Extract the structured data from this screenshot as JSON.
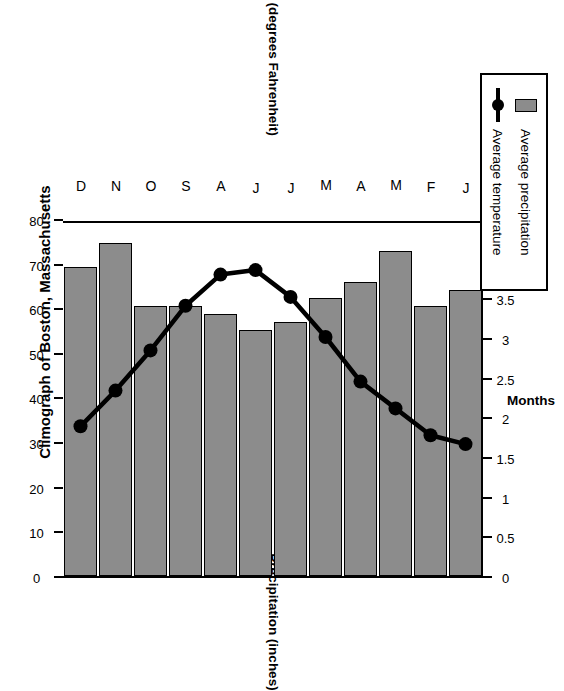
{
  "chart_data": {
    "type": "bar",
    "title": "Climograph of Boston, Massachusetts",
    "orientation": "rotated-90",
    "categories": [
      "J",
      "F",
      "M",
      "A",
      "M",
      "J",
      "J",
      "A",
      "S",
      "O",
      "N",
      "D"
    ],
    "xlabel": "Months",
    "series": [
      {
        "name": "Average precipitation",
        "type": "bar",
        "unit": "inches",
        "axis": "precipitation",
        "color": "#8c8c8c",
        "values": [
          3.6,
          3.4,
          4.1,
          3.7,
          3.5,
          3.2,
          3.1,
          3.3,
          3.4,
          3.4,
          4.2,
          3.9
        ]
      },
      {
        "name": "Average temperature",
        "type": "line",
        "unit": "degrees Fahrenheit",
        "axis": "temperature",
        "color": "#000000",
        "values": [
          30,
          32,
          38,
          44,
          54,
          63,
          69,
          68,
          61,
          51,
          42,
          34
        ]
      }
    ],
    "axes": {
      "precipitation": {
        "label": "Precipitation (inches)",
        "min": 0,
        "max": 4.5,
        "ticks": [
          "0",
          "0.5",
          "1",
          "1.5",
          "2",
          "2.5",
          "3",
          "3.5",
          "4",
          "4.5"
        ],
        "tick_values": [
          0,
          0.5,
          1,
          1.5,
          2,
          2.5,
          3,
          3.5,
          4,
          4.5
        ],
        "position": "bottom"
      },
      "temperature": {
        "label": "Temperature (degrees Fahrenheit)",
        "min": 0,
        "max": 80,
        "ticks": [
          "0",
          "10",
          "20",
          "30",
          "40",
          "50",
          "60",
          "70",
          "80"
        ],
        "tick_values": [
          0,
          10,
          20,
          30,
          40,
          50,
          60,
          70,
          80
        ],
        "position": "top"
      }
    },
    "grid": false,
    "legend": {
      "position": "right",
      "entries": [
        {
          "label": "Average precipitation",
          "key": "bar-swatch"
        },
        {
          "label": "Average temperature",
          "key": "line-marker"
        }
      ]
    }
  },
  "colors": {
    "bar_fill": "#8c8c8c",
    "bar_stroke": "#000000",
    "line": "#000000",
    "background": "#ffffff"
  }
}
